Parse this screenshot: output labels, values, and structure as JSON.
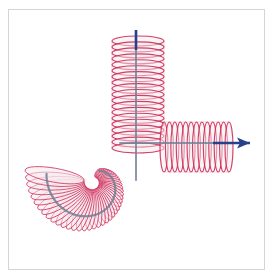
{
  "figure": {
    "background_color": "#ffffff",
    "border_color": "#d5d5d5",
    "width": 274,
    "height": 279
  },
  "colors": {
    "coil_stroke": "#cf2f5c",
    "coil_fill": "#f5e9ec",
    "coil_stroke_light": "#d9778f",
    "guide_path": "#6e7f93",
    "axis_arrow": "#27408b",
    "frame": "#d5d5d5"
  },
  "chart_data": {
    "type": "line",
    "xlabel": "",
    "ylabel": "",
    "xlim": [
      0,
      274
    ],
    "ylim": [
      279,
      0
    ],
    "grid": false,
    "legend": null,
    "annotations": [],
    "series": [
      {
        "name": "spiral-coil",
        "description": "Archimedean spiral coil in lower-left quadrant winding inward to a central point",
        "center": [
          93,
          182
        ],
        "outer_radius": 60,
        "inner_radius": 12,
        "turns": 42,
        "coil_amplitude": 14,
        "angle_start_deg": 300,
        "angle_sweep_deg": 250
      },
      {
        "name": "vertical-helix",
        "description": "Vertical helix rising from the spiral junction to the top of the figure",
        "x_center": 138,
        "y_top": 41,
        "y_bottom": 148,
        "half_width": 26,
        "coils": 18,
        "ellipse_ry": 5
      },
      {
        "name": "horizontal-helix",
        "description": "Horizontal helix extending right from the junction toward the arrow",
        "y_center": 147,
        "x_left": 164,
        "x_right": 229,
        "half_height": 25,
        "coils": 12,
        "ellipse_rx": 4
      },
      {
        "name": "guide-curve",
        "description": "Slate-gray guide path: spiral arc turning into the vertical and horizontal axes",
        "stroke_width": 2.2
      }
    ],
    "axes_arrows": [
      {
        "name": "vertical-axis",
        "from": [
          136,
          50
        ],
        "to": [
          136,
          30
        ],
        "direction": "up",
        "arrowhead": false,
        "color": "#27408b"
      },
      {
        "name": "horizontal-axis",
        "from": [
          213,
          143
        ],
        "to": [
          250,
          143
        ],
        "direction": "right",
        "arrowhead": true,
        "color": "#27408b"
      }
    ]
  }
}
